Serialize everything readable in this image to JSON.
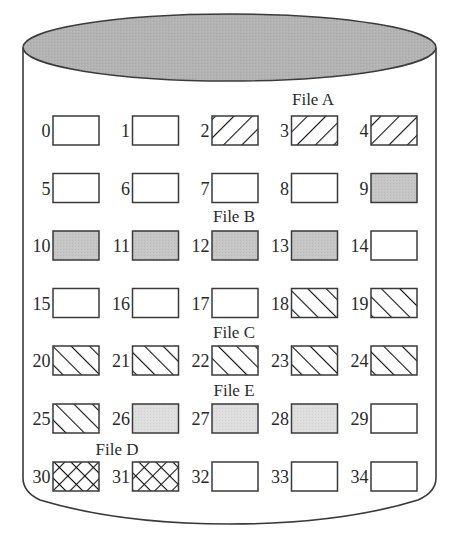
{
  "diagram": {
    "type": "disk-block-allocation",
    "shape": "cylinder",
    "colors": {
      "outline": "#3a3a3a",
      "disk_top_fill": "#b3b3b3",
      "free_fill": "#ffffff",
      "file_b_fill": "#c6c6c6",
      "file_e_fill": "#dedede",
      "hatch_stroke": "#111111"
    },
    "grid": {
      "columns": 5,
      "rows": 7
    },
    "file_labels": [
      {
        "id": "A",
        "text": "File A",
        "x": 313,
        "y": 105
      },
      {
        "id": "B",
        "text": "File B",
        "x": 234,
        "y": 222
      },
      {
        "id": "C",
        "text": "File C",
        "x": 234,
        "y": 338
      },
      {
        "id": "E",
        "text": "File E",
        "x": 234,
        "y": 396
      },
      {
        "id": "D",
        "text": "File D",
        "x": 117,
        "y": 455
      }
    ],
    "fill_legend": {
      "free": "blank",
      "A": "hatch-backslash",
      "B": "gray-dark",
      "C": "hatch-slash",
      "D": "crosshatch",
      "E": "gray-light"
    },
    "blocks": [
      {
        "n": "0",
        "file": "free"
      },
      {
        "n": "1",
        "file": "free"
      },
      {
        "n": "2",
        "file": "A"
      },
      {
        "n": "3",
        "file": "A"
      },
      {
        "n": "4",
        "file": "A"
      },
      {
        "n": "5",
        "file": "free"
      },
      {
        "n": "6",
        "file": "free"
      },
      {
        "n": "7",
        "file": "free"
      },
      {
        "n": "8",
        "file": "free"
      },
      {
        "n": "9",
        "file": "B"
      },
      {
        "n": "10",
        "file": "B"
      },
      {
        "n": "11",
        "file": "B"
      },
      {
        "n": "12",
        "file": "B"
      },
      {
        "n": "13",
        "file": "B"
      },
      {
        "n": "14",
        "file": "free"
      },
      {
        "n": "15",
        "file": "free"
      },
      {
        "n": "16",
        "file": "free"
      },
      {
        "n": "17",
        "file": "free"
      },
      {
        "n": "18",
        "file": "C"
      },
      {
        "n": "19",
        "file": "C"
      },
      {
        "n": "20",
        "file": "C"
      },
      {
        "n": "21",
        "file": "C"
      },
      {
        "n": "22",
        "file": "C"
      },
      {
        "n": "23",
        "file": "C"
      },
      {
        "n": "24",
        "file": "C"
      },
      {
        "n": "25",
        "file": "C"
      },
      {
        "n": "26",
        "file": "E"
      },
      {
        "n": "27",
        "file": "E"
      },
      {
        "n": "28",
        "file": "E"
      },
      {
        "n": "29",
        "file": "free"
      },
      {
        "n": "30",
        "file": "D"
      },
      {
        "n": "31",
        "file": "D"
      },
      {
        "n": "32",
        "file": "free"
      },
      {
        "n": "33",
        "file": "free"
      },
      {
        "n": "34",
        "file": "free"
      }
    ]
  }
}
